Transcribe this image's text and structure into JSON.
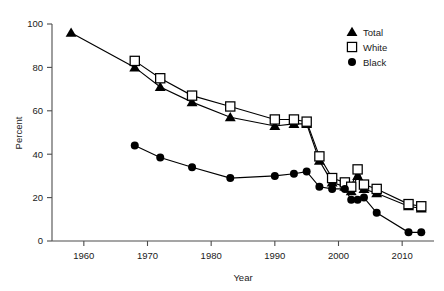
{
  "chart_data": {
    "type": "line",
    "title": "",
    "xlabel": "Year",
    "ylabel": "Percent",
    "xlim": [
      1955,
      2015
    ],
    "ylim": [
      0,
      100
    ],
    "xticks": [
      1960,
      1970,
      1980,
      1990,
      2000,
      2010
    ],
    "xtick_labels": [
      "1960",
      "1970",
      "1980",
      "1990",
      "2000",
      "2010"
    ],
    "yticks": [
      0,
      20,
      40,
      60,
      80,
      100
    ],
    "ytick_labels": [
      "0",
      "20",
      "40",
      "60",
      "80",
      "100"
    ],
    "grid": false,
    "legend_position": "top-right",
    "series": [
      {
        "name": "Total",
        "marker": "filled-triangle",
        "x": [
          1958,
          1968,
          1972,
          1977,
          1983,
          1990,
          1993,
          1995,
          1997,
          1999,
          2001,
          2002,
          2003,
          2004,
          2006,
          2011,
          2013
        ],
        "values": [
          96,
          80,
          71,
          64,
          57,
          53,
          54,
          54,
          37,
          27,
          25,
          23,
          30,
          24,
          22,
          16,
          15
        ]
      },
      {
        "name": "White",
        "marker": "open-square",
        "x": [
          1968,
          1972,
          1977,
          1983,
          1990,
          1993,
          1995,
          1997,
          1999,
          2001,
          2002,
          2003,
          2004,
          2006,
          2011,
          2013
        ],
        "values": [
          83,
          75,
          67,
          62,
          56,
          56,
          55,
          39,
          29,
          27,
          25,
          33,
          26,
          24,
          17,
          16
        ]
      },
      {
        "name": "Black",
        "marker": "filled-circle",
        "x": [
          1968,
          1972,
          1977,
          1983,
          1990,
          1993,
          1995,
          1997,
          1999,
          2001,
          2002,
          2003,
          2004,
          2006,
          2011,
          2013
        ],
        "values": [
          44,
          38.5,
          34,
          29,
          30,
          31,
          32,
          25,
          24,
          24,
          19,
          19,
          20,
          13,
          4,
          4
        ]
      }
    ]
  },
  "legend": {
    "items": [
      {
        "label": "Total",
        "marker": "filled-triangle"
      },
      {
        "label": "White",
        "marker": "open-square"
      },
      {
        "label": "Black",
        "marker": "filled-circle"
      }
    ]
  },
  "colors": {
    "ink": "#000000",
    "axis": "#4d4d4d",
    "background": "#ffffff"
  }
}
